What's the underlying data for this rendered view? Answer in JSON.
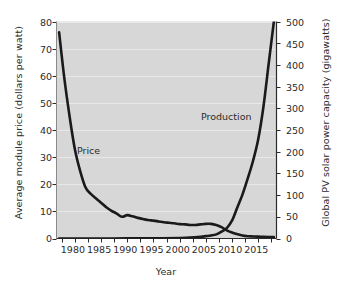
{
  "chart_data": {
    "type": "line",
    "title": "",
    "xlabel": "Year",
    "ylabel": "Average module price (dollars per watt)",
    "ylabel_right": "Global PV solar power capacity (gigawatts)",
    "xlim": [
      1976.5,
      2018.5
    ],
    "ylim": [
      0,
      80
    ],
    "ylim_right": [
      0,
      500
    ],
    "grid": "horizontal-faint",
    "legend": "inline-annotations",
    "plot_background": "#d7d7d7",
    "line_color": "#1a1a1a",
    "xticks": [
      1980,
      1985,
      1990,
      1995,
      2000,
      2005,
      2010,
      2015
    ],
    "xtick_labels": [
      "1980",
      "1985",
      "1990",
      "1995",
      "2000",
      "2005",
      "2010",
      "2015"
    ],
    "yticks_left": [
      0,
      10,
      20,
      30,
      40,
      50,
      60,
      70,
      80
    ],
    "ytick_labels_left": [
      "0",
      "10",
      "20",
      "30",
      "40",
      "50",
      "60",
      "70",
      "80"
    ],
    "yticks_right": [
      0,
      50,
      100,
      150,
      200,
      250,
      300,
      350,
      400,
      450,
      500
    ],
    "ytick_labels_right": [
      "0",
      "50",
      "100",
      "150",
      "200",
      "250",
      "300",
      "350",
      "400",
      "450",
      "500"
    ],
    "annotations": [
      {
        "text": "Price",
        "x": 1985.0,
        "y": 31.0,
        "axis": "left"
      },
      {
        "text": "Production",
        "x": 2010.5,
        "y": 290.0,
        "axis": "right"
      }
    ],
    "series": [
      {
        "name": "Price",
        "axis": "left",
        "unit": "dollars per watt",
        "x": [
          1977,
          1978,
          1979,
          1980,
          1981,
          1982,
          1983,
          1984,
          1985,
          1986,
          1987,
          1988,
          1989,
          1990,
          1991,
          1992,
          1993,
          1994,
          1995,
          1996,
          1997,
          1998,
          1999,
          2000,
          2001,
          2002,
          2003,
          2004,
          2005,
          2006,
          2007,
          2008,
          2009,
          2010,
          2011,
          2012,
          2013,
          2014,
          2015,
          2016,
          2017,
          2018
        ],
        "values": [
          76.0,
          59.0,
          45.0,
          33.0,
          25.0,
          19.0,
          16.5,
          14.8,
          13.2,
          11.5,
          10.2,
          9.2,
          8.0,
          8.6,
          8.2,
          7.6,
          7.2,
          6.8,
          6.6,
          6.3,
          6.0,
          5.8,
          5.6,
          5.3,
          5.2,
          5.0,
          5.0,
          5.2,
          5.4,
          5.4,
          5.0,
          4.2,
          3.0,
          2.2,
          1.6,
          1.1,
          0.85,
          0.75,
          0.68,
          0.62,
          0.55,
          0.5
        ]
      },
      {
        "name": "Production",
        "axis": "right",
        "unit": "gigawatts",
        "x": [
          1977,
          1980,
          1985,
          1990,
          1995,
          2000,
          2002,
          2004,
          2005,
          2006,
          2007,
          2008,
          2009,
          2010,
          2011,
          2012,
          2013,
          2014,
          2015,
          2016,
          2017,
          2018
        ],
        "values": [
          0.0,
          0.0,
          0.1,
          0.2,
          0.5,
          1.3,
          2.0,
          3.9,
          5.4,
          7.0,
          9.5,
          16.0,
          24.0,
          41.0,
          71.0,
          101.0,
          138.0,
          178.0,
          228.0,
          303.0,
          402.0,
          500.0
        ]
      }
    ]
  }
}
